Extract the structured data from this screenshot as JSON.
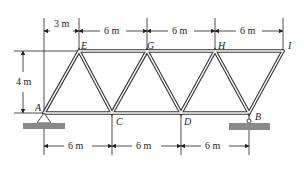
{
  "diagram": {
    "type": "planar truss (Warren truss)",
    "nodes": {
      "A": "A",
      "C": "C",
      "D": "D",
      "B": "B",
      "E": "E",
      "G": "G",
      "H": "H",
      "I": "I"
    },
    "dimensions": {
      "top_offset": "3 m",
      "top_1": "6 m",
      "top_2": "6 m",
      "top_3": "6 m",
      "top_4": "6 m",
      "height": "4 m",
      "bottom_1": "6 m",
      "bottom_2": "6 m",
      "bottom_3": "6 m"
    },
    "supports": {
      "A": "pin support",
      "B": "roller support"
    },
    "colors": {
      "member": "#333333",
      "ground": "#888888",
      "dim_line": "#222222"
    }
  }
}
